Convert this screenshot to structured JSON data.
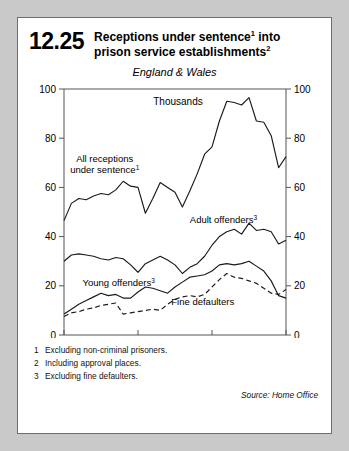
{
  "figure": {
    "number": "12.25",
    "title_line1": "Receptions under sentence",
    "title_sup1": "1",
    "title_line1_tail": " into",
    "title_line2": "prison service establishments",
    "title_sup2": "2",
    "region": "England & Wales"
  },
  "footnotes": [
    {
      "num": "1",
      "text": "Excluding non-criminal prisoners."
    },
    {
      "num": "2",
      "text": "Including approval places."
    },
    {
      "num": "3",
      "text": "Excluding fine defaulters."
    }
  ],
  "source": "Source: Home Office",
  "chart_data": {
    "type": "line",
    "subtitle": "England & Wales",
    "unit_label": "Thousands",
    "xlabel": "",
    "ylabel": "Thousands",
    "xlim": [
      1961,
      1991
    ],
    "ylim": [
      0,
      100
    ],
    "yticks": [
      0,
      20,
      40,
      60,
      80,
      100
    ],
    "ytick_labels": [
      "0",
      "20",
      "40",
      "60",
      "80",
      "100"
    ],
    "xticks": [
      1961,
      1971,
      1981,
      1991
    ],
    "xtick_labels": [
      "1961",
      "1971",
      "1981",
      "1991"
    ],
    "grid": false,
    "dual_y_axis": true,
    "legend": "inline-annotations",
    "x": [
      1961,
      1962,
      1963,
      1964,
      1965,
      1966,
      1967,
      1968,
      1969,
      1970,
      1971,
      1972,
      1973,
      1974,
      1975,
      1976,
      1977,
      1978,
      1979,
      1980,
      1981,
      1982,
      1983,
      1984,
      1985,
      1986,
      1987,
      1988,
      1989,
      1990,
      1991
    ],
    "series": [
      {
        "name": "All receptions under sentence",
        "name_sup": "1",
        "style": "solid",
        "label_x": 1966.5,
        "label_y": 70.5,
        "values": [
          46.5,
          53.5,
          55.5,
          55.0,
          56.5,
          57.5,
          57.0,
          59.0,
          62.5,
          60.5,
          60.0,
          49.5,
          55.5,
          62.0,
          60.0,
          58.0,
          52.0,
          58.5,
          65.5,
          73.5,
          76.5,
          87.0,
          95.0,
          94.5,
          93.5,
          96.5,
          87.0,
          86.5,
          81.0,
          68.0,
          72.5
        ]
      },
      {
        "name": "Adult offenders",
        "name_sup": "3",
        "style": "solid",
        "label_x": 1978.0,
        "label_y": 45.5,
        "values": [
          30.0,
          32.5,
          33.0,
          32.5,
          32.0,
          31.0,
          30.5,
          31.5,
          31.0,
          28.5,
          25.5,
          29.0,
          30.5,
          32.0,
          30.5,
          28.5,
          25.0,
          27.5,
          29.0,
          32.0,
          36.5,
          40.0,
          42.0,
          43.0,
          41.0,
          45.5,
          42.5,
          43.0,
          42.0,
          37.0,
          38.5
        ]
      },
      {
        "name": "Young offenders",
        "name_sup": "3",
        "style": "solid",
        "label_x": 1963.5,
        "label_y": 20.0,
        "values": [
          8.5,
          10.5,
          12.5,
          14.0,
          15.5,
          17.0,
          16.0,
          16.5,
          15.0,
          15.0,
          17.5,
          19.5,
          19.0,
          18.0,
          17.0,
          19.5,
          21.5,
          23.5,
          24.0,
          24.5,
          26.0,
          28.5,
          29.0,
          28.5,
          29.0,
          30.0,
          28.0,
          26.0,
          22.0,
          16.0,
          15.0
        ]
      },
      {
        "name": "Fine defaulters",
        "style": "dashed",
        "label_x": 1975.5,
        "label_y": 12.0,
        "values": [
          7.5,
          9.0,
          9.5,
          10.5,
          11.0,
          12.0,
          12.5,
          13.0,
          8.5,
          9.0,
          9.5,
          10.0,
          10.5,
          10.0,
          12.5,
          14.5,
          15.5,
          16.0,
          15.5,
          16.5,
          19.5,
          22.5,
          25.0,
          23.5,
          23.0,
          22.0,
          21.0,
          19.0,
          17.0,
          16.5,
          18.5
        ]
      }
    ]
  }
}
